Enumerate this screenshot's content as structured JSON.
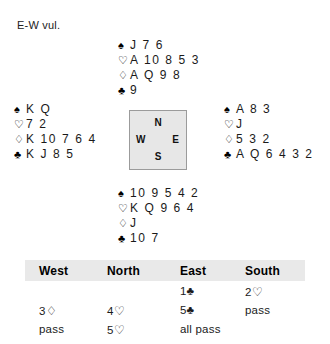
{
  "vulnerability": "E-W vul.",
  "suits": {
    "spade": "♠",
    "heart": "♡",
    "diamond": "♢",
    "club": "♣",
    "club_filled": "♣"
  },
  "compass": {
    "north": "N",
    "west": "W",
    "east": "E",
    "south": "S"
  },
  "hands": {
    "north": {
      "label": "North",
      "spades": "J 7 6",
      "hearts": "A 10 8 5 3",
      "diamonds": "A Q 9 8",
      "clubs": "9"
    },
    "west": {
      "label": "West",
      "spades": "K Q",
      "hearts": "7 2",
      "diamonds": "K 10 7 6 4",
      "clubs": "K J 8 5"
    },
    "east": {
      "label": "East",
      "spades": "A 8 3",
      "hearts": "J",
      "diamonds": "5 3 2",
      "clubs": "A Q 6 4 3 2"
    },
    "south": {
      "label": "South",
      "spades": "10 9 5 4 2",
      "hearts": "K Q 9 6 4",
      "diamonds": "J",
      "clubs": "10 7"
    }
  },
  "auction": {
    "headers": [
      "West",
      "North",
      "East",
      "South"
    ],
    "rows": [
      {
        "west": "",
        "north": "",
        "east": "1♣",
        "south": "2♡"
      },
      {
        "west": "3♢",
        "north": "4♡",
        "east": "5♣",
        "south": "pass"
      },
      {
        "west": "pass",
        "north": "5♡",
        "east": "all pass",
        "south": ""
      }
    ]
  }
}
